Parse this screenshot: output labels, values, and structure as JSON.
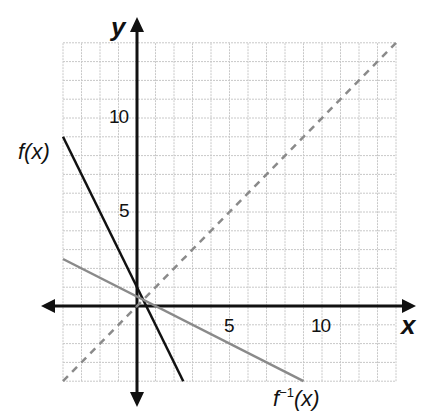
{
  "chart_data": {
    "type": "line",
    "title": "",
    "xlabel": "x",
    "ylabel": "y",
    "xlim": [
      -4,
      14
    ],
    "ylim": [
      -4,
      14
    ],
    "grid": true,
    "x_ticks_labeled": [
      5,
      10
    ],
    "y_ticks_labeled": [
      5,
      10
    ],
    "series": [
      {
        "name": "f(x)",
        "equation": "y = -2x + 1",
        "style": "solid",
        "color": "#111111",
        "points": [
          [
            -4,
            9
          ],
          [
            2.5,
            -4
          ]
        ]
      },
      {
        "name": "f^-1(x)",
        "equation": "y = -0.5x + 0.5",
        "style": "solid",
        "color": "#8a8a8a",
        "points": [
          [
            -4,
            2.5
          ],
          [
            9,
            -4
          ]
        ]
      },
      {
        "name": "y = x",
        "equation": "y = x",
        "style": "dashed",
        "color": "#8a8a8a",
        "points": [
          [
            -4,
            -4
          ],
          [
            14,
            14
          ]
        ]
      }
    ]
  },
  "labels": {
    "x_axis": "x",
    "y_axis": "y",
    "x_tick_5": "5",
    "x_tick_10": "10",
    "y_tick_5": "5",
    "y_tick_10": "10",
    "f_label_prefix": "f(",
    "f_label_var": "x",
    "f_label_suffix": ")",
    "finv_label_f": "f",
    "finv_label_sup": "−1",
    "finv_label_rest": "(x)"
  },
  "colors": {
    "grid": "#c8c8c8",
    "axis": "#111111",
    "f": "#111111",
    "finv": "#8a8a8a",
    "identity": "#8a8a8a"
  }
}
